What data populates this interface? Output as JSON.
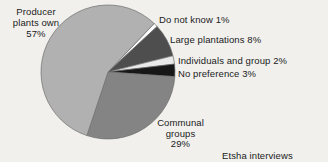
{
  "background_color": "#f1f0ed",
  "text_color": "#1b1b1b",
  "chart_data": {
    "type": "pie",
    "title": "",
    "annotation": "Etsha interviews (n=123)",
    "legend_position": "none",
    "unit": "%",
    "total": 100,
    "start_angle_deg": 46.4,
    "direction": "clockwise",
    "stroke_color": "#6f6f6f",
    "slices": [
      {
        "label": "Do not know",
        "pct": 1,
        "color": "#fcfcfc"
      },
      {
        "label": "Large plantations",
        "pct": 8,
        "color": "#4e4e4e"
      },
      {
        "label": "Individuals and group",
        "pct": 2,
        "color": "#e9e9e9"
      },
      {
        "label": "No preference",
        "pct": 3,
        "color": "#171717"
      },
      {
        "label": "Communal groups",
        "pct": 29,
        "color": "#848484"
      },
      {
        "label": "Producer plants own",
        "pct": 57,
        "color": "#b1b1b1"
      }
    ]
  },
  "labels": {
    "producer": "Producer\nplants own\n57%",
    "do_not_know": "Do not know 1%",
    "large_plantations": "Large plantations 8%",
    "individuals": "Individuals and group 2%",
    "no_preference": "No preference 3%",
    "communal": "Communal\ngroups\n29%",
    "note": "Etsha interviews (n=123)"
  }
}
